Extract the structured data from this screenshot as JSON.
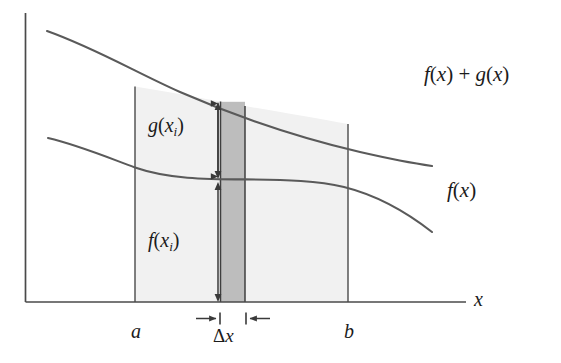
{
  "figure": {
    "background_color": "#ffffff",
    "ink_color": "#4a4a4a",
    "text_color": "#1b1b1b",
    "region_fill": "#f1f1f1",
    "strip_fill": "#bdbdbd",
    "axes": {
      "x_axis_label": "x",
      "y_axis_present": true
    },
    "curves": [
      {
        "name": "upper-curve",
        "label": "f(x) + g(x)",
        "label_parts": {
          "f": "f",
          "open1": "(",
          "x1": "x",
          "close1": ")",
          "plus": " + ",
          "g": "g",
          "open2": "(",
          "x2": "x",
          "close2": ")"
        }
      },
      {
        "name": "lower-curve",
        "label": "f(x)",
        "label_parts": {
          "f": "f",
          "open": "(",
          "x": "x",
          "close": ")"
        }
      }
    ],
    "region_labels": {
      "upper_band": {
        "base": "g",
        "open": "(",
        "var": "x",
        "sub": "i",
        "close": ")",
        "full": "g(xᵢ)"
      },
      "lower_band": {
        "base": "f",
        "open": "(",
        "var": "x",
        "sub": "i",
        "close": ")",
        "full": "f(xᵢ)"
      }
    },
    "axis_marks": {
      "left_bound": "a",
      "right_bound": "b",
      "strip_width_delta": "Δ",
      "strip_width_var": "x",
      "strip_width_full": "Δx"
    },
    "annotations": [
      {
        "name": "g-height-arrow",
        "type": "double-headed-vertical-arrow",
        "describes": "g(xᵢ)"
      },
      {
        "name": "f-height-arrow",
        "type": "double-headed-vertical-arrow",
        "describes": "f(xᵢ)"
      },
      {
        "name": "delta-x-arrows",
        "type": "inward-horizontal-arrow-pair",
        "describes": "Δx"
      }
    ]
  }
}
